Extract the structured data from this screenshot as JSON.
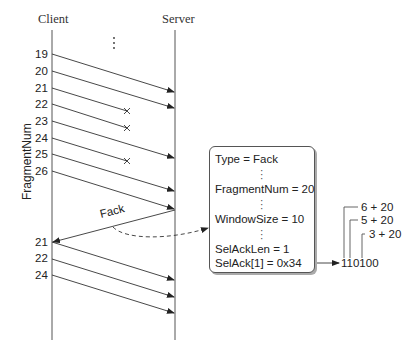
{
  "header": {
    "client_label": "Client",
    "server_label": "Server",
    "ellipsis": "⋮"
  },
  "axis_label": "FragmentNum",
  "initial_fragments": [
    {
      "num": "19",
      "status": "delivered"
    },
    {
      "num": "20",
      "status": "delivered"
    },
    {
      "num": "21",
      "status": "lost"
    },
    {
      "num": "22",
      "status": "lost"
    },
    {
      "num": "23",
      "status": "delivered"
    },
    {
      "num": "24",
      "status": "lost"
    },
    {
      "num": "25",
      "status": "delivered"
    },
    {
      "num": "26",
      "status": "delivered"
    }
  ],
  "ack_label": "Fack",
  "retransmitted_fragments": [
    "21",
    "22",
    "24"
  ],
  "fack_packet": {
    "type": "Type = Fack",
    "fragment_num": "FragmentNum = 20",
    "window_size": "WindowSize = 10",
    "sel_ack_len": "SelAckLen = 1",
    "sel_ack": "SelAck[1] = 0x34"
  },
  "bitmap": {
    "value": "110100",
    "annotations": [
      "6 + 20",
      "5 + 20",
      "3 + 20"
    ]
  },
  "colors": {
    "line": "#333333",
    "text": "#222222",
    "box_border": "#555555"
  }
}
